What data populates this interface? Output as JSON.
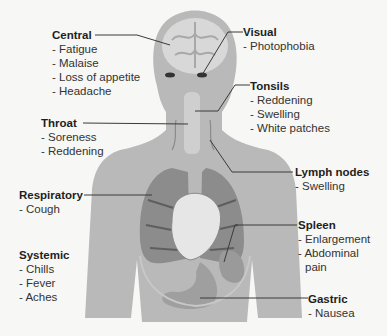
{
  "diagram": {
    "type": "anatomical-symptom-map",
    "colors": {
      "background": "#f7f7f5",
      "silhouette": "#b9b9b9",
      "organ_dark": "#6f6f6f",
      "organ_light": "#e2e2e2",
      "leader_line": "#3a3a3a",
      "text": "#2b2b2b"
    },
    "labels": {
      "central": {
        "title": "Central",
        "items": [
          "- Fatigue",
          "- Malaise",
          "- Loss of appetite",
          "- Headache"
        ]
      },
      "visual": {
        "title": "Visual",
        "items": [
          "- Photophobia"
        ]
      },
      "tonsils": {
        "title": "Tonsils",
        "items": [
          "- Reddening",
          "- Swelling",
          "- White patches"
        ]
      },
      "throat": {
        "title": "Throat",
        "items": [
          "- Soreness",
          "- Reddening"
        ]
      },
      "lymph_nodes": {
        "title": "Lymph nodes",
        "items": [
          "- Swelling"
        ]
      },
      "respiratory": {
        "title": "Respiratory",
        "items": [
          "- Cough"
        ]
      },
      "spleen": {
        "title": "Spleen",
        "items": [
          "- Enlargement",
          "- Abdominal",
          "pain"
        ]
      },
      "systemic": {
        "title": "Systemic",
        "items": [
          "- Chills",
          "- Fever",
          "- Aches"
        ]
      },
      "gastric": {
        "title": "Gastric",
        "items": [
          "- Nausea"
        ]
      }
    }
  }
}
